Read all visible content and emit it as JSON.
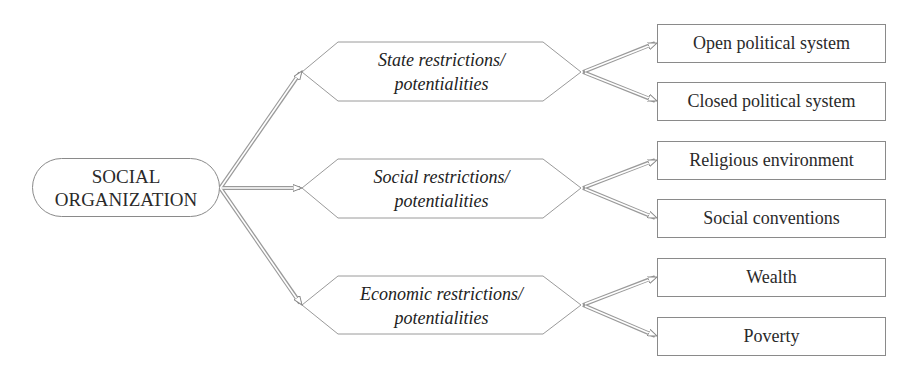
{
  "diagram": {
    "root": {
      "line1": "SOCIAL",
      "line2": "ORGANIZATION"
    },
    "categories": [
      {
        "line1": "State restrictions/",
        "line2": "potentialities",
        "children": [
          "Open political system",
          "Closed political system"
        ]
      },
      {
        "line1": "Social restrictions/",
        "line2": "potentialities",
        "children": [
          "Religious environment",
          "Social conventions"
        ]
      },
      {
        "line1": "Economic restrictions/",
        "line2": "potentialities",
        "children": [
          "Wealth",
          "Poverty"
        ]
      }
    ],
    "colors": {
      "border": "#8a8a8a",
      "arrow": "#9a9a9a",
      "text": "#2a2a2a"
    }
  }
}
